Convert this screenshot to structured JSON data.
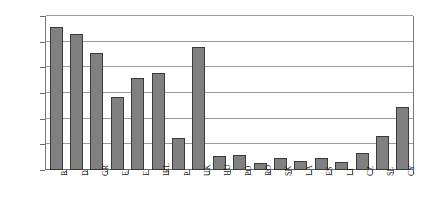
{
  "chart_data": {
    "type": "bar",
    "title": "",
    "subtitle": "",
    "xlabel": "",
    "ylabel": "",
    "categories": [
      "B",
      "D",
      "GR",
      "E",
      "F",
      "IRL",
      "P",
      "UK",
      "HU",
      "PO",
      "RO",
      "SK",
      "LA",
      "ES",
      "LI",
      "CZ",
      "SL",
      "CY"
    ],
    "values": [
      2780,
      2650,
      2280,
      1430,
      1800,
      1890,
      630,
      2400,
      280,
      300,
      140,
      240,
      170,
      240,
      150,
      330,
      670,
      1230
    ],
    "series": [
      {
        "name": "",
        "values": [
          2780,
          2650,
          2280,
          1430,
          1800,
          1890,
          630,
          2400,
          280,
          300,
          140,
          240,
          170,
          240,
          150,
          330,
          670,
          1230
        ]
      }
    ],
    "ylim": [
      0,
      3000
    ],
    "yticks": [
      0,
      500,
      1000,
      1500,
      2000,
      2500,
      3000
    ],
    "ytick_labels": [
      "0",
      "500",
      "1000",
      "1500",
      "2000",
      "2500",
      "3000"
    ],
    "grid": true,
    "grid_axis": "y",
    "legend": false,
    "legend_position": "none",
    "bar_color": "#808080",
    "bar_border_color": "#3a3a3a",
    "gridline_color": "#9b9b9b",
    "axis_color": "#6b6b6b",
    "xlabel_rotation": -90,
    "annotations": []
  }
}
